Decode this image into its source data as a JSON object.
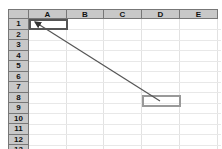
{
  "spreadsheet": {
    "columns": [
      {
        "label": "A",
        "x": 21,
        "w": 38
      },
      {
        "label": "B",
        "x": 59,
        "w": 37
      },
      {
        "label": "C",
        "x": 96,
        "w": 38
      },
      {
        "label": "D",
        "x": 134,
        "w": 38
      },
      {
        "label": "E",
        "x": 172,
        "w": 38
      }
    ],
    "rows": [
      "1",
      "2",
      "3",
      "4",
      "5",
      "6",
      "7",
      "8",
      "9",
      "10",
      "11",
      "12",
      "13"
    ],
    "active_cell": "A1",
    "highlighted_cell": "D9",
    "arrow": {
      "from": "D9",
      "to": "A1",
      "color": "#555555"
    },
    "colors": {
      "header_bg": "#c8c8c8",
      "active_border": "#555555",
      "highlight_border": "#999999"
    }
  }
}
